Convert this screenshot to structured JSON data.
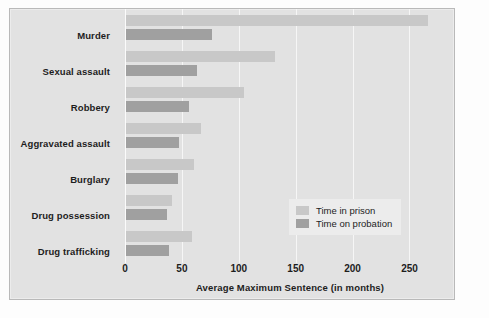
{
  "chart_data": {
    "type": "bar",
    "orientation": "horizontal",
    "title": "",
    "xlabel": "Average Maximum Sentence (in months)",
    "ylabel": "",
    "xlim": [
      0,
      290
    ],
    "xticks": [
      0,
      50,
      100,
      150,
      200,
      250
    ],
    "xtick_labels": [
      "0",
      "50",
      "100",
      "150",
      "200",
      "250"
    ],
    "grid": true,
    "legend_position": "center-right",
    "categories": [
      "Murder",
      "Sexual assault",
      "Robbery",
      "Aggravated assault",
      "Burglary",
      "Drug possession",
      "Drug trafficking"
    ],
    "series": [
      {
        "name": "Time in prison",
        "color": "#c8c8c8",
        "values": [
          265,
          131,
          104,
          66,
          60,
          40,
          58
        ]
      },
      {
        "name": "Time on probation",
        "color": "#a0a0a0",
        "values": [
          76,
          62,
          55,
          47,
          46,
          36,
          38
        ]
      }
    ]
  },
  "legend": {
    "items": [
      {
        "label": "Time in prison"
      },
      {
        "label": "Time on probation"
      }
    ]
  },
  "colors": {
    "prison": "#c8c8c8",
    "probation": "#a0a0a0",
    "panel_background": "#e2e2e2",
    "gridline": "#f6f6f6",
    "text": "#1d1d1d"
  }
}
